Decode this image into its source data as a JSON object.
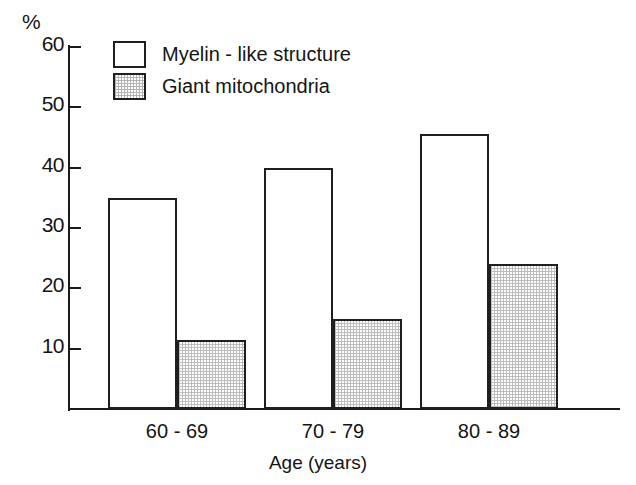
{
  "chart_data": {
    "type": "bar",
    "title": "",
    "subtitle": "",
    "xlabel": "Age (years)",
    "ylabel": "%",
    "ylim": [
      0,
      60
    ],
    "ytick_labels": [
      "60",
      "50",
      "40",
      "30",
      "20",
      "10"
    ],
    "ytick_values": [
      60,
      50,
      40,
      30,
      20,
      10
    ],
    "grid": false,
    "legend_position": "top-left",
    "categories": [
      "60-69",
      "70-79",
      "80-89"
    ],
    "series": [
      {
        "name": "Myelin - like structure",
        "fill": "open",
        "values": [
          35,
          40,
          45.5
        ]
      },
      {
        "name": "Giant mitochondria",
        "fill": "stippled",
        "values": [
          11.5,
          15,
          24
        ]
      }
    ]
  },
  "axis": {
    "y_unit_label": "%",
    "x_title": "Age (years)"
  },
  "legend": {
    "items": [
      {
        "label": "Myelin - like structure",
        "swatch": "open-box-swatch"
      },
      {
        "label": "Giant mitochondria",
        "swatch": "stippled-box-swatch"
      }
    ]
  },
  "colors": {
    "ink": "#141414",
    "bar_outline": "#1f1f1f",
    "open_fill": "#ffffff",
    "stipple_fill": "#bdbdbd",
    "background": "#ffffff"
  }
}
